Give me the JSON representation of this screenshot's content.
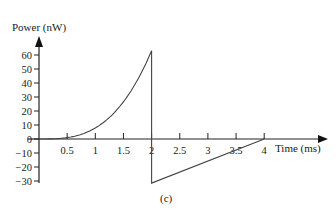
{
  "chart_data": {
    "type": "line",
    "title": "",
    "caption": "(c)",
    "xlabel": "Time (ms)",
    "ylabel": "Power (nW)",
    "xlim": [
      0,
      4.5
    ],
    "ylim": [
      -30,
      70
    ],
    "grid": false,
    "legend": null,
    "x_ticks": [
      "0.5",
      "1",
      "1.5",
      "2",
      "2.5",
      "3",
      "3.5",
      "4"
    ],
    "y_ticks": [
      "60",
      "50",
      "40",
      "30",
      "20",
      "10",
      "0",
      "−10",
      "−20",
      "−30"
    ],
    "series": [
      {
        "name": "power",
        "x": [
          0,
          0.25,
          0.5,
          0.75,
          1.0,
          1.25,
          1.5,
          1.75,
          2.0,
          2.0,
          4.0,
          4.5
        ],
        "y": [
          0,
          0.1,
          1.0,
          3.3,
          7.9,
          15.4,
          26.6,
          42.2,
          63,
          -31.5,
          0,
          0
        ]
      }
    ],
    "annotations": []
  },
  "axes": {
    "x_title": "Time (ms)",
    "y_title": "Power (nW)",
    "caption": "(c)"
  }
}
